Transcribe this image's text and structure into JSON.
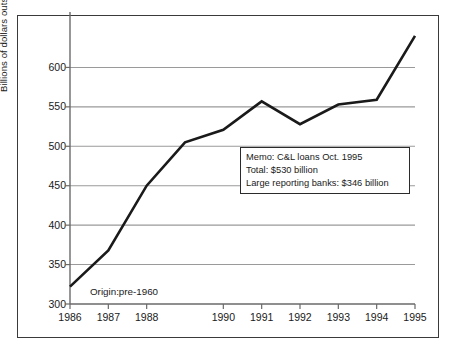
{
  "figure": {
    "origin_note": "Origin:pre-1960",
    "frame_color": "#3a3a3a",
    "background": "#ffffff"
  },
  "memo": {
    "line1": "Memo: C&L loans Oct. 1995",
    "line2": "Total: $530 billion",
    "line3": "Large reporting banks: $346 billion"
  },
  "chart_data": {
    "type": "line",
    "title": "",
    "xlabel": "",
    "ylabel": "Billions of dollars outstanding",
    "ylim": [
      300,
      650
    ],
    "xlim": [
      1986,
      1995
    ],
    "grid": true,
    "legend": "none",
    "line_color": "#1a1a1a",
    "gridline_color": "#9a9a9a",
    "y_ticks": [
      300,
      350,
      400,
      450,
      500,
      550,
      600
    ],
    "y_tick_labels": [
      "300",
      "350",
      "400",
      "450",
      "500",
      "550",
      "600"
    ],
    "x_ticks": [
      1986,
      1987,
      1988,
      1989,
      1990,
      1991,
      1992,
      1993,
      1994,
      1995
    ],
    "x_tick_labels": [
      "1986",
      "1987",
      "1988",
      "",
      "1990",
      "1991",
      "1992",
      "1993",
      "1994",
      "1995"
    ],
    "x": [
      1986,
      1987,
      1988,
      1989,
      1990,
      1991,
      1992,
      1993,
      1994,
      1995
    ],
    "values": [
      322,
      368,
      450,
      505,
      521,
      557,
      528,
      553,
      559,
      640
    ],
    "series": [
      {
        "name": "Commercial and industrial loans outstanding",
        "values": [
          322,
          368,
          450,
          505,
          521,
          557,
          528,
          553,
          559,
          640
        ]
      }
    ]
  }
}
